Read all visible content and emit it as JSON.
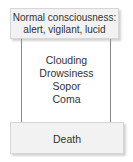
{
  "diagram": {
    "top_box": {
      "line1": "Normal consciousness:",
      "line2": "alert, vigilant, lucid"
    },
    "stages": [
      "Clouding",
      "Drowsiness",
      "Sopor",
      "Coma"
    ],
    "bottom_box": {
      "label": "Death"
    },
    "colors": {
      "box_fill": "#f2f2f2",
      "box_border": "#d6d6d6",
      "line": "#888888",
      "text": "#333333"
    }
  }
}
